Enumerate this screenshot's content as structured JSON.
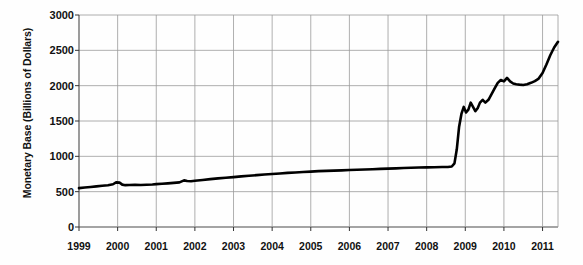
{
  "chart_data": {
    "type": "line",
    "title": "",
    "xlabel": "",
    "ylabel": "Monetary Base (Billions of Dollars)",
    "xlim": [
      1999,
      2011.4
    ],
    "ylim": [
      0,
      3000
    ],
    "grid": true,
    "legend": "none",
    "y_ticks": [
      0,
      500,
      1000,
      1500,
      2000,
      2500,
      3000
    ],
    "y_tick_labels": [
      "0",
      "500",
      "1000",
      "1500",
      "2000",
      "2500",
      "3000"
    ],
    "x_ticks": [
      1999,
      2000,
      2001,
      2002,
      2003,
      2004,
      2005,
      2006,
      2007,
      2008,
      2009,
      2010,
      2011
    ],
    "x_tick_labels": [
      "1999",
      "2000",
      "2001",
      "2002",
      "2003",
      "2004",
      "2005",
      "2006",
      "2007",
      "2008",
      "2009",
      "2010",
      "2011"
    ],
    "series": [
      {
        "name": "Monetary Base",
        "color": "#000000",
        "x": [
          1999.0,
          1999.15,
          1999.3,
          1999.45,
          1999.6,
          1999.75,
          1999.88,
          1999.96,
          2000.05,
          2000.12,
          2000.2,
          2000.3,
          2000.45,
          2000.6,
          2000.75,
          2000.9,
          2001.0,
          2001.15,
          2001.3,
          2001.45,
          2001.6,
          2001.72,
          2001.8,
          2001.9,
          2002.0,
          2002.2,
          2002.4,
          2002.6,
          2002.8,
          2003.0,
          2003.2,
          2003.4,
          2003.6,
          2003.8,
          2004.0,
          2004.2,
          2004.4,
          2004.6,
          2004.8,
          2005.0,
          2005.2,
          2005.4,
          2005.6,
          2005.8,
          2006.0,
          2006.2,
          2006.4,
          2006.6,
          2006.8,
          2007.0,
          2007.2,
          2007.4,
          2007.6,
          2007.8,
          2008.0,
          2008.2,
          2008.4,
          2008.55,
          2008.65,
          2008.72,
          2008.78,
          2008.84,
          2008.9,
          2008.96,
          2009.02,
          2009.08,
          2009.14,
          2009.2,
          2009.26,
          2009.32,
          2009.38,
          2009.45,
          2009.52,
          2009.6,
          2009.68,
          2009.76,
          2009.84,
          2009.92,
          2010.0,
          2010.08,
          2010.16,
          2010.24,
          2010.32,
          2010.4,
          2010.5,
          2010.6,
          2010.7,
          2010.8,
          2010.9,
          2011.0,
          2011.1,
          2011.2,
          2011.3,
          2011.4
        ],
        "y": [
          550,
          558,
          566,
          575,
          583,
          592,
          605,
          632,
          628,
          600,
          592,
          594,
          596,
          595,
          598,
          602,
          607,
          612,
          618,
          624,
          631,
          660,
          650,
          648,
          655,
          666,
          678,
          688,
          698,
          706,
          716,
          726,
          734,
          742,
          750,
          758,
          766,
          772,
          778,
          784,
          790,
          794,
          798,
          802,
          806,
          810,
          814,
          818,
          822,
          826,
          830,
          834,
          838,
          841,
          844,
          846,
          848,
          850,
          856,
          900,
          1100,
          1420,
          1600,
          1700,
          1620,
          1660,
          1760,
          1700,
          1640,
          1680,
          1760,
          1800,
          1760,
          1800,
          1880,
          1960,
          2040,
          2080,
          2060,
          2110,
          2060,
          2030,
          2020,
          2015,
          2010,
          2020,
          2040,
          2065,
          2100,
          2180,
          2300,
          2430,
          2540,
          2620
        ]
      }
    ]
  },
  "geometry": {
    "plot_left": 79,
    "plot_right": 558,
    "plot_top": 15,
    "plot_bottom": 227
  }
}
